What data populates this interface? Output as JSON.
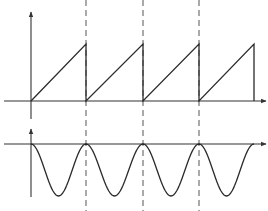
{
  "diagram": {
    "colors": {
      "stroke": "#2a2a2a",
      "axis": "#333333",
      "dashed": "#555555",
      "background": "#ffffff"
    },
    "geometry": {
      "origin_x": 31,
      "period_px": 56.5,
      "periods": 4,
      "dashed_x": [
        86,
        143,
        199
      ],
      "top": {
        "axis_y": 101,
        "peak_y": 44,
        "yaxis_top": 12,
        "xaxis_start": 4,
        "xaxis_end": 266
      },
      "bottom": {
        "axis_y": 144,
        "trough_y": 196,
        "yaxis_top": 129,
        "yaxis_bottom": 197,
        "xaxis_start": 4,
        "xaxis_end": 266
      },
      "dash_top": 0,
      "dash_bottom": 211
    },
    "top_plot": {
      "name": "sawtooth",
      "shape": "sawtooth ramp rising linearly from 0 to peak each period, then dropping vertically to 0",
      "cycles": 4
    },
    "bottom_plot": {
      "name": "cosine-wave",
      "shape": "cosine wave touching axis at each period boundary and dipping to minimum mid-period",
      "cycles": 4
    }
  }
}
